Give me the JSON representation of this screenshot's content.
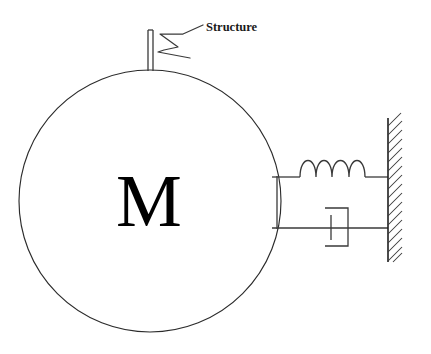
{
  "diagram": {
    "background_color": "#ffffff",
    "line_color": "#3a3a3a",
    "text_color": "#000000",
    "mass": {
      "label": "M",
      "shape": "circle",
      "center_x": 150,
      "center_y": 201,
      "radius": 131
    },
    "annotation": {
      "label": "Structure",
      "label_x": 206,
      "label_y": 31,
      "leader": "zigzag"
    },
    "stem": {
      "x": 150,
      "top_y": 30,
      "bottom_y": 71,
      "width": 5
    },
    "spring": {
      "coils": 4,
      "baseline_y": 177,
      "start_x": 277,
      "end_x": 388,
      "coil_start_x": 300,
      "coil_end_x": 365,
      "amplitude": 19
    },
    "damper": {
      "baseline_y": 228,
      "start_x": 277,
      "end_x": 388,
      "cylinder_left_x": 325,
      "cylinder_right_x": 348,
      "cylinder_top_y": 208,
      "cylinder_bottom_y": 246,
      "piston_x": 331
    },
    "wall": {
      "x": 388,
      "top_y": 118,
      "bottom_y": 262,
      "hatch_count": 16,
      "hatch_length": 18
    }
  }
}
